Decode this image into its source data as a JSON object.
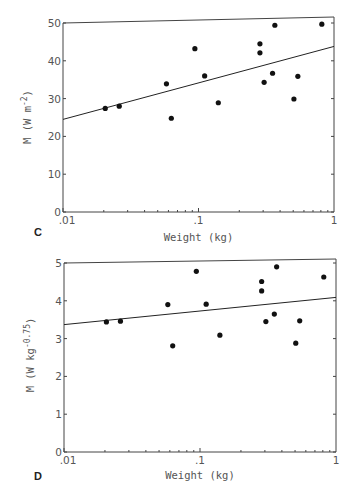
{
  "chart_data": [
    {
      "panel": "C",
      "type": "scatter",
      "xlabel": "Weight (kg)",
      "ylabel": "M (W m^-2)",
      "ylabel_display": {
        "base": "M (W m",
        "sup": "-2",
        "close": ")"
      },
      "xscale": "log",
      "xlim": [
        0.01,
        1
      ],
      "ylim": [
        0,
        50
      ],
      "xticks": [
        ".01",
        ".1",
        "1"
      ],
      "yticks": [
        "0",
        "10",
        "20",
        "30",
        "40",
        "50"
      ],
      "grid": false,
      "points": [
        {
          "x": 0.0205,
          "y": 27.4
        },
        {
          "x": 0.026,
          "y": 28.0
        },
        {
          "x": 0.058,
          "y": 33.9
        },
        {
          "x": 0.063,
          "y": 24.8
        },
        {
          "x": 0.094,
          "y": 43.2
        },
        {
          "x": 0.111,
          "y": 36.0
        },
        {
          "x": 0.14,
          "y": 28.9
        },
        {
          "x": 0.284,
          "y": 44.5
        },
        {
          "x": 0.284,
          "y": 42.1
        },
        {
          "x": 0.305,
          "y": 34.3
        },
        {
          "x": 0.352,
          "y": 36.7
        },
        {
          "x": 0.366,
          "y": 49.4
        },
        {
          "x": 0.506,
          "y": 29.9
        },
        {
          "x": 0.541,
          "y": 35.9
        },
        {
          "x": 0.813,
          "y": 49.7
        }
      ],
      "regression_line": {
        "x": [
          0.01,
          1
        ],
        "y": [
          24.5,
          43.8
        ]
      }
    },
    {
      "panel": "D",
      "type": "scatter",
      "xlabel": "Weight (kg)",
      "ylabel": "M (W kg^-0.75)",
      "ylabel_display": {
        "base": "M (W kg",
        "sup": "-0.75",
        "close": ")"
      },
      "xscale": "log",
      "xlim": [
        0.01,
        1
      ],
      "ylim": [
        0,
        5
      ],
      "xticks": [
        ".01",
        ".1",
        "1"
      ],
      "yticks": [
        "0",
        "1",
        "2",
        "3",
        "4",
        "5"
      ],
      "grid": false,
      "points": [
        {
          "x": 0.0205,
          "y": 3.44
        },
        {
          "x": 0.026,
          "y": 3.46
        },
        {
          "x": 0.058,
          "y": 3.9
        },
        {
          "x": 0.063,
          "y": 2.81
        },
        {
          "x": 0.094,
          "y": 4.78
        },
        {
          "x": 0.111,
          "y": 3.91
        },
        {
          "x": 0.14,
          "y": 3.09
        },
        {
          "x": 0.284,
          "y": 4.51
        },
        {
          "x": 0.284,
          "y": 4.26
        },
        {
          "x": 0.305,
          "y": 3.45
        },
        {
          "x": 0.352,
          "y": 3.65
        },
        {
          "x": 0.366,
          "y": 4.9
        },
        {
          "x": 0.506,
          "y": 2.88
        },
        {
          "x": 0.541,
          "y": 3.47
        },
        {
          "x": 0.813,
          "y": 4.63
        }
      ],
      "regression_line": {
        "x": [
          0.01,
          1
        ],
        "y": [
          3.37,
          4.09
        ]
      }
    }
  ],
  "panels": {
    "c": {
      "letter": "C",
      "xlabel": "Weight (kg)"
    },
    "d": {
      "letter": "D",
      "xlabel": "Weight (kg)"
    }
  },
  "style": {
    "ink": "#222222",
    "axis": "#444444",
    "label": "#555555",
    "background": "#ffffff"
  }
}
